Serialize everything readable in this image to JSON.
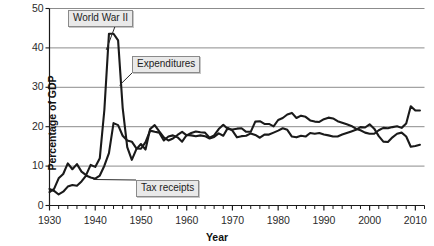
{
  "chart_data": {
    "type": "line",
    "title": "",
    "xlabel": "Year",
    "ylabel": "Percentage of GDP",
    "xlim": [
      1930,
      2012
    ],
    "ylim": [
      0,
      50
    ],
    "grid": true,
    "gridlines_y": [
      10,
      20,
      30,
      40,
      50
    ],
    "legend_position": "inline-callouts",
    "x_ticks": [
      1930,
      1940,
      1950,
      1960,
      1970,
      1980,
      1990,
      2000,
      2010
    ],
    "x_tick_labels": [
      "1930",
      "1940",
      "1950",
      "1960",
      "1970",
      "1980",
      "1990",
      "2000",
      "2010"
    ],
    "x_minor_tick_interval": 2,
    "y_ticks": [
      0,
      10,
      20,
      30,
      40,
      50
    ],
    "y_tick_labels": [
      "0",
      "10",
      "20",
      "30",
      "40",
      "50"
    ],
    "line_color": "#1a1a1a",
    "grid_color": "#8c8c8c",
    "series": [
      {
        "name": "Expenditures",
        "x": [
          1930,
          1931,
          1932,
          1933,
          1934,
          1935,
          1936,
          1937,
          1938,
          1939,
          1940,
          1941,
          1942,
          1943,
          1944,
          1945,
          1946,
          1947,
          1948,
          1949,
          1950,
          1951,
          1952,
          1953,
          1954,
          1955,
          1956,
          1957,
          1958,
          1959,
          1960,
          1961,
          1962,
          1963,
          1964,
          1965,
          1966,
          1967,
          1968,
          1969,
          1970,
          1971,
          1972,
          1973,
          1974,
          1975,
          1976,
          1977,
          1978,
          1979,
          1980,
          1981,
          1982,
          1983,
          1984,
          1985,
          1986,
          1987,
          1988,
          1989,
          1990,
          1991,
          1992,
          1993,
          1994,
          1995,
          1996,
          1997,
          1998,
          1999,
          2000,
          2001,
          2002,
          2003,
          2004,
          2005,
          2006,
          2007,
          2008,
          2009,
          2010,
          2011
        ],
        "values": [
          3.4,
          4.2,
          6.9,
          8.0,
          10.7,
          9.2,
          10.5,
          8.6,
          7.7,
          10.3,
          9.8,
          12.0,
          24.3,
          43.6,
          43.6,
          41.9,
          24.8,
          14.8,
          11.6,
          14.3,
          15.6,
          14.2,
          19.4,
          20.4,
          18.8,
          17.3,
          16.5,
          17.0,
          17.9,
          18.7,
          17.8,
          18.4,
          18.8,
          18.6,
          18.5,
          17.2,
          17.8,
          19.4,
          20.5,
          19.4,
          19.3,
          19.5,
          19.6,
          18.7,
          18.7,
          21.3,
          21.4,
          20.7,
          20.7,
          20.1,
          21.7,
          22.2,
          23.1,
          23.5,
          22.2,
          22.8,
          22.5,
          21.6,
          21.3,
          21.2,
          21.9,
          22.3,
          22.1,
          21.4,
          21.0,
          20.6,
          20.2,
          19.5,
          19.1,
          18.5,
          18.2,
          18.2,
          19.1,
          19.7,
          19.6,
          19.9,
          20.1,
          19.7,
          20.8,
          25.2,
          24.1,
          24.1
        ]
      },
      {
        "name": "Tax receipts",
        "x": [
          1930,
          1931,
          1932,
          1933,
          1934,
          1935,
          1936,
          1937,
          1938,
          1939,
          1940,
          1941,
          1942,
          1943,
          1944,
          1945,
          1946,
          1947,
          1948,
          1949,
          1950,
          1951,
          1952,
          1953,
          1954,
          1955,
          1956,
          1957,
          1958,
          1959,
          1960,
          1961,
          1962,
          1963,
          1964,
          1965,
          1966,
          1967,
          1968,
          1969,
          1970,
          1971,
          1972,
          1973,
          1974,
          1975,
          1976,
          1977,
          1978,
          1979,
          1980,
          1981,
          1982,
          1983,
          1984,
          1985,
          1986,
          1987,
          1988,
          1989,
          1990,
          1991,
          1992,
          1993,
          1994,
          1995,
          1996,
          1997,
          1998,
          1999,
          2000,
          2001,
          2002,
          2003,
          2004,
          2005,
          2006,
          2007,
          2008,
          2009,
          2010,
          2011
        ],
        "values": [
          4.2,
          3.7,
          2.8,
          3.5,
          4.8,
          5.2,
          5.0,
          6.1,
          7.6,
          7.1,
          6.8,
          7.6,
          10.1,
          13.3,
          20.9,
          20.4,
          17.7,
          16.5,
          16.2,
          14.5,
          14.4,
          16.1,
          19.0,
          18.7,
          18.5,
          16.5,
          17.5,
          17.8,
          17.3,
          16.2,
          17.9,
          17.8,
          17.6,
          17.8,
          17.6,
          17.0,
          17.4,
          18.3,
          17.7,
          19.7,
          19.0,
          17.3,
          17.6,
          17.7,
          18.3,
          17.9,
          17.2,
          18.0,
          18.0,
          18.5,
          19.0,
          19.6,
          19.2,
          17.5,
          17.3,
          17.7,
          17.5,
          18.4,
          18.2,
          18.4,
          18.0,
          17.8,
          17.5,
          17.5,
          18.0,
          18.4,
          18.8,
          19.2,
          19.9,
          19.8,
          20.6,
          19.5,
          17.6,
          16.2,
          16.1,
          17.3,
          18.2,
          18.5,
          17.5,
          14.9,
          15.1,
          15.4
        ]
      }
    ],
    "annotations": [
      {
        "id": "world-war-ii",
        "label": "World War II",
        "box_x": 68,
        "box_y": 10,
        "point_x": 1942.4,
        "point_y": 39.5
      },
      {
        "id": "expenditures",
        "label": "Expenditures",
        "box_x": 132,
        "box_y": 56,
        "point_x": 1945.3,
        "point_y": 30.5
      },
      {
        "id": "tax-receipts",
        "label": "Tax receipts",
        "box_x": 136,
        "box_y": 180,
        "point_x": 1939.6,
        "point_y": 6.6
      }
    ]
  }
}
